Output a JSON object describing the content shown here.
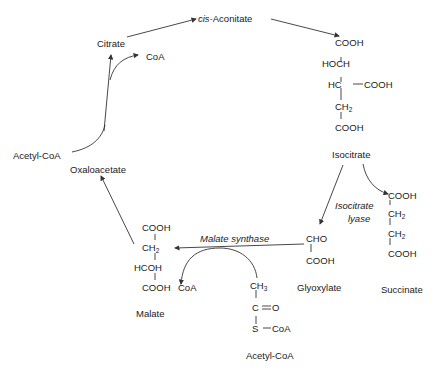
{
  "diagram": {
    "nodes": {
      "citrate": "Citrate",
      "cis_aconitate_prefix": "cis-",
      "cis_aconitate_rest": "Aconitate",
      "coa_top": "CoA",
      "acetyl_coa_left": "Acetyl-CoA",
      "oxaloacetate": "Oxaloacetate",
      "isocitrate": "Isocitrate",
      "glyoxylate": "Glyoxylate",
      "succinate": "Succinate",
      "malate": "Malate",
      "coa_bottom": "CoA",
      "acetyl_coa_bottom": "Acetyl-CoA"
    },
    "enzymes": {
      "isocitrate_lyase_1": "Isocitrate",
      "isocitrate_lyase_2": "lyase",
      "malate_synthase": "Malate synthase"
    },
    "isocitrate_structure": [
      "COOH",
      "HOCH",
      "HC",
      "COOH",
      "CH",
      "2",
      "COOH"
    ],
    "glyoxylate_structure": [
      "CHO",
      "COOH"
    ],
    "succinate_structure": [
      "COOH",
      "CH",
      "2",
      "CH",
      "2",
      "COOH"
    ],
    "malate_structure": [
      "COOH",
      "CH",
      "2",
      "HCOH",
      "COOH"
    ],
    "acetyl_coa_structure": [
      "CH",
      "3",
      "C",
      "O",
      "S",
      "CoA"
    ]
  }
}
